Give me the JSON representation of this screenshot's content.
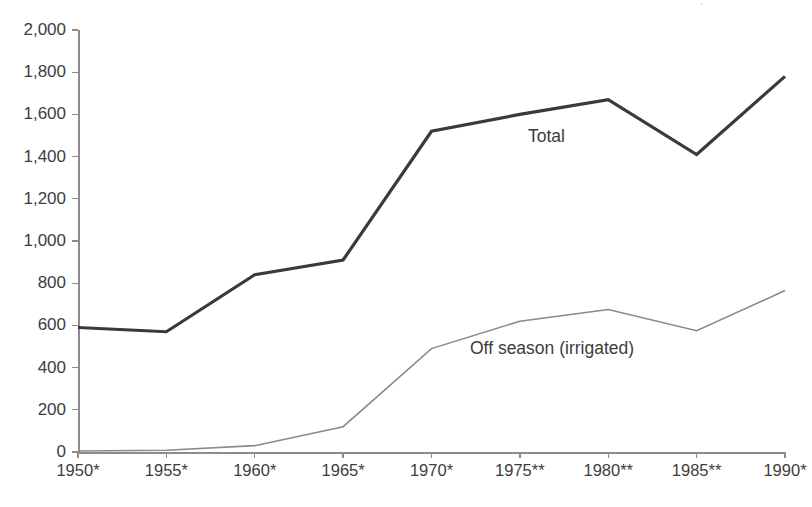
{
  "title_fragment": "  .          ",
  "chart_data": {
    "type": "line",
    "title": "",
    "subtitle": "",
    "xlabel": "",
    "ylabel": "",
    "categories": [
      "1950*",
      "1955*",
      "1960*",
      "1965*",
      "1970*",
      "1975**",
      "1980**",
      "1985**",
      "1990*"
    ],
    "series": [
      {
        "name": "Total",
        "label": "Total",
        "color": "#3a3a3a",
        "line_width": 3.2,
        "values": [
          590,
          570,
          840,
          910,
          1520,
          1600,
          1670,
          1410,
          1780
        ]
      },
      {
        "name": "Off season (irrigated)",
        "label": "Off season (irrigated)",
        "color": "#8a8a8a",
        "line_width": 1.6,
        "values": [
          5,
          8,
          30,
          120,
          490,
          620,
          675,
          575,
          765
        ]
      }
    ],
    "ylim": [
      0,
      2000
    ],
    "yticks": [
      0,
      200,
      400,
      600,
      800,
      1000,
      1200,
      1400,
      1600,
      1800,
      2000
    ],
    "ytick_labels": [
      "0",
      "200",
      "400",
      "600",
      "800",
      "1,000",
      "1,200",
      "1,400",
      "1,600",
      "1,800",
      "2,000"
    ],
    "grid": false,
    "legend": "inline-labels",
    "legend_position": "inline"
  },
  "axis_colors": {
    "axis": "#8c8c8c",
    "text": "#3d3d3d",
    "background": "#ffffff"
  }
}
